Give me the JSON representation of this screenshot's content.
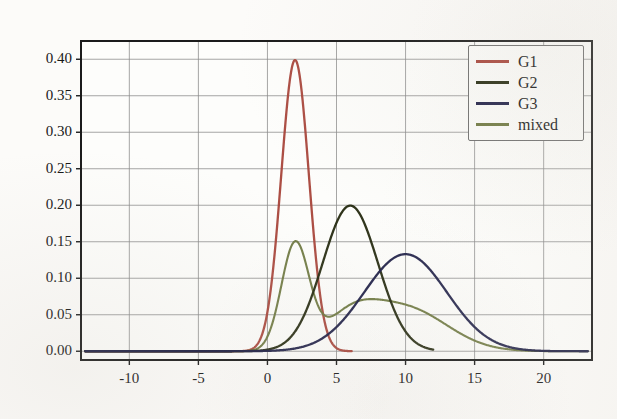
{
  "chart_data": {
    "type": "line",
    "title": "",
    "xlabel": "",
    "ylabel": "",
    "xlim": [
      -13.5,
      23.5
    ],
    "ylim": [
      -0.012,
      0.425
    ],
    "xticks": [
      -10,
      -5,
      0,
      5,
      10,
      15,
      20
    ],
    "yticks": [
      0.0,
      0.05,
      0.1,
      0.15,
      0.2,
      0.25,
      0.3,
      0.35,
      0.4
    ],
    "xtick_labels": [
      "-10",
      "-5",
      "0",
      "5",
      "10",
      "15",
      "20"
    ],
    "ytick_labels": [
      "0.00",
      "0.05",
      "0.10",
      "0.15",
      "0.20",
      "0.25",
      "0.30",
      "0.35",
      "0.40"
    ],
    "grid": true,
    "legend_position": "upper right",
    "series": [
      {
        "name": "G1",
        "color": "#a8443a",
        "distribution": "gaussian",
        "mean": 2,
        "sigma": 1,
        "weight": 1,
        "peak_value": 0.399,
        "peak_x": 2,
        "x_start": -13.2,
        "x_end": 6.1
      },
      {
        "name": "G2",
        "color": "#24290f",
        "distribution": "gaussian",
        "mean": 6,
        "sigma": 2,
        "weight": 1,
        "peak_value": 0.199,
        "peak_x": 6,
        "x_start": -13.2,
        "x_end": 12.0
      },
      {
        "name": "G3",
        "color": "#1e1f47",
        "distribution": "gaussian",
        "mean": 10,
        "sigma": 3,
        "weight": 1,
        "peak_value": 0.133,
        "peak_x": 10,
        "x_start": -13.2,
        "x_end": 23.2
      },
      {
        "name": "mixed",
        "color": "#6e7840",
        "distribution": "gaussian-mixture",
        "components": [
          {
            "mean": 2,
            "sigma": 1,
            "weight": 0.36
          },
          {
            "mean": 6,
            "sigma": 2,
            "weight": 0.2
          },
          {
            "mean": 10,
            "sigma": 3,
            "weight": 0.44
          }
        ],
        "peak_value": 0.145,
        "peak_x": 2,
        "secondary_peak_value": 0.09,
        "secondary_peak_x": 6.6,
        "valley_value": 0.065,
        "valley_x": 4.5,
        "x_start": -13.2,
        "x_end": 23.2
      }
    ],
    "legend_entries": [
      "G1",
      "G2",
      "G3",
      "mixed"
    ]
  },
  "style": {
    "background": "#fcfbf9",
    "grid_color": "#8b8b8b",
    "axis_color": "#1b1b1b",
    "tick_label_color": "#181818"
  }
}
